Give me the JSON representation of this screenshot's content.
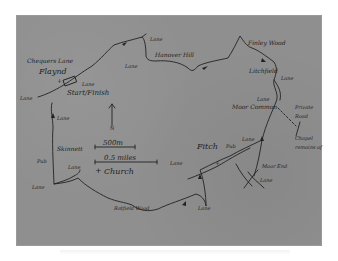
{
  "map": {
    "type": "hand-drawn walking route map (photographed)",
    "colors": {
      "paper": "#8f8f8f",
      "ink": "#1e1e1e",
      "background": "#ffffff"
    },
    "labels": {
      "chequers_lane": "Chequers Lane",
      "flaynd": "Flaynd",
      "lane_start": "Lane",
      "start_finish": "Start/Finish",
      "lane_west": "Lane",
      "lane_north": "Lane",
      "lane_hanover": "Lane",
      "hanover_hill": "Hanover Hill",
      "finley_wood": "Finley Wood",
      "litchfield": "Litchfield",
      "lane_east": "Lane",
      "lane_common": "Lane",
      "moor_common": "Moor Common",
      "private_road": "Private Road",
      "chapel_remains": "Chapel remains of",
      "lane_west2": "Lane",
      "skinnett": "Skinnett",
      "pub_west": "Pub",
      "lane_sw_small": "Lane",
      "lane_sw": "Lane",
      "fitch": "Fitch",
      "pub_fitch": "Pub",
      "lane_fitch_e": "Lane",
      "lane_fitch_w": "Lane",
      "moor_end": "Moor End",
      "lane_moor_end": "Lane",
      "lane_south": "Lane",
      "ratfield_wood": "Ratfield Wood"
    },
    "legend": {
      "north": "N",
      "scale_metric": "500m",
      "scale_imperial": "0.5 miles",
      "church_symbol": "+",
      "church_label": "Church"
    }
  }
}
